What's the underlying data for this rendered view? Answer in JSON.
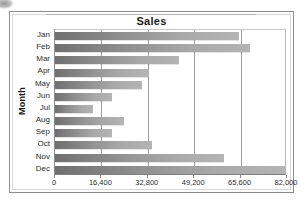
{
  "chart_data": {
    "type": "bar",
    "orientation": "horizontal",
    "title": "Sales",
    "xlabel": "",
    "ylabel": "Month",
    "categories": [
      "Jan",
      "Feb",
      "Mar",
      "Apr",
      "May",
      "Jun",
      "Jul",
      "Aug",
      "Sep",
      "Oct",
      "Nov",
      "Dec"
    ],
    "values": [
      65000,
      69000,
      44000,
      33200,
      30700,
      20100,
      13400,
      24400,
      20100,
      34300,
      59700,
      82000
    ],
    "xlim": [
      0,
      82000
    ],
    "xticks": [
      0,
      16400,
      32800,
      49200,
      65600,
      82000
    ],
    "xtick_labels": [
      "0",
      "16,400",
      "32,800",
      "49,200",
      "65,600",
      "82,000"
    ],
    "grid": "vertical",
    "legend": "none",
    "bar_color": "#8c8c8c",
    "frame_color": "#8d8d8d",
    "text_color": "#1a1a1a"
  }
}
